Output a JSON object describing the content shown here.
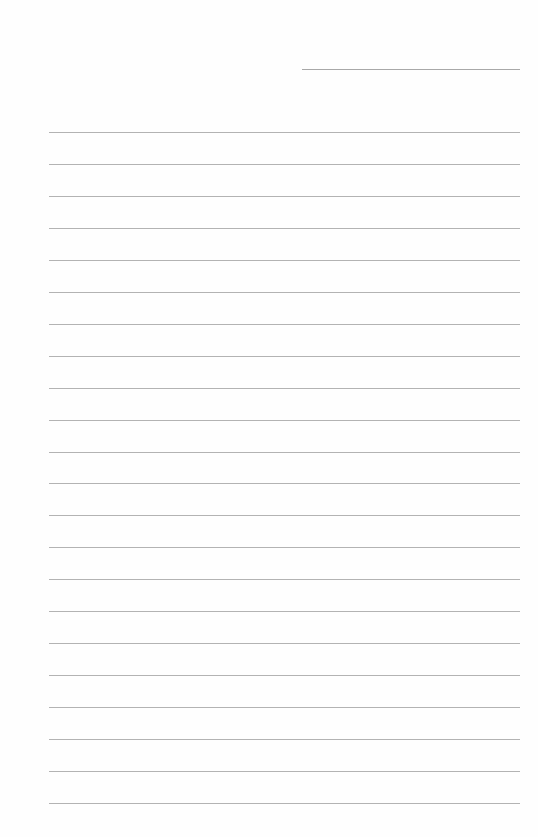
{
  "page": {
    "type": "blank lined paper",
    "background": "#fefefe",
    "line_color": "#b3b3b3",
    "header_line": {
      "x1": 302,
      "x2": 520,
      "y": 69
    },
    "rules": {
      "count": 22,
      "x1": 49,
      "x2": 520,
      "first_y": 132,
      "spacing": 31.95
    }
  }
}
